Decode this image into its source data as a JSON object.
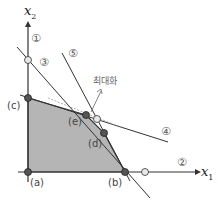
{
  "diagram": {
    "axes": {
      "x_label": "x",
      "x_sub": "1",
      "y_label": "x",
      "y_sub": "2"
    },
    "constraint_labels": [
      "①",
      "②",
      "③",
      "④",
      "⑤"
    ],
    "objective_label": "최대화",
    "vertices": [
      {
        "id": "a",
        "label": "(a)"
      },
      {
        "id": "b",
        "label": "(b)"
      },
      {
        "id": "c",
        "label": "(c)"
      },
      {
        "id": "d",
        "label": "(d)"
      },
      {
        "id": "e",
        "label": "(e)"
      }
    ],
    "colors": {
      "feasible_region": "#b5b5b5",
      "lines": "#333333",
      "vertex_fill": "#555555",
      "infeasible_point_fill": "#e8e8e8",
      "dashed_objective": "#999999"
    }
  }
}
